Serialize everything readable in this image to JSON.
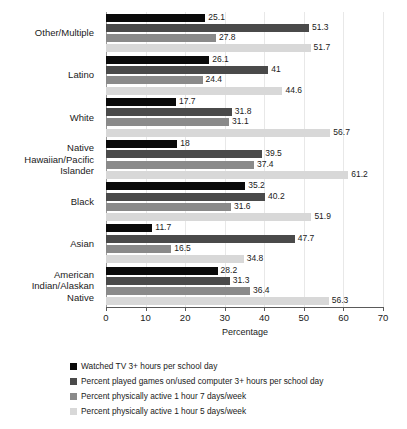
{
  "chart_data": {
    "type": "bar",
    "orientation": "horizontal",
    "title": "",
    "xlabel": "Percentage",
    "ylabel": "",
    "xlim": [
      0,
      70
    ],
    "xticks": [
      0,
      10,
      20,
      30,
      40,
      50,
      60,
      70
    ],
    "grid": true,
    "legend_position": "bottom",
    "categories": [
      "Other/Multiple",
      "Latino",
      "White",
      "Native Hawaiian/Pacific Islander",
      "Black",
      "Asian",
      "American Indian/Alaskan Native"
    ],
    "category_lines": [
      [
        "Other/Multiple"
      ],
      [
        "Latino"
      ],
      [
        "White"
      ],
      [
        "Native",
        "Hawaiian/Pacific",
        "Islander"
      ],
      [
        "Black"
      ],
      [
        "Asian"
      ],
      [
        "American",
        "Indian/Alaskan",
        "Native"
      ]
    ],
    "series": [
      {
        "name": "Watched TV 3+ hours per school day",
        "color": "#0a0a0a",
        "values": [
          25.1,
          26.1,
          17.7,
          18,
          35.2,
          11.7,
          28.2
        ],
        "labels": [
          "25.1",
          "26.1",
          "17.7",
          "18",
          "35.2",
          "11.7",
          "28.2"
        ]
      },
      {
        "name": "Percent played games on/used computer 3+ hours per school day",
        "color": "#4a4a4a",
        "values": [
          51.3,
          41,
          31.8,
          39.5,
          40.2,
          47.7,
          31.3
        ],
        "labels": [
          "51.3",
          "41",
          "31.8",
          "39.5",
          "40.2",
          "47.7",
          "31.3"
        ]
      },
      {
        "name": "Percent physically active 1 hour 7 days/week",
        "color": "#8a8a8a",
        "values": [
          27.8,
          24.4,
          31.1,
          37.4,
          31.6,
          16.5,
          36.4
        ],
        "labels": [
          "27.8",
          "24.4",
          "31.1",
          "37.4",
          "31.6",
          "16.5",
          "36.4"
        ]
      },
      {
        "name": "Percent physically active 1 hour 5 days/week",
        "color": "#d8d8d8",
        "values": [
          51.7,
          44.6,
          56.7,
          61.2,
          51.9,
          34.8,
          56.3
        ],
        "labels": [
          "51.7",
          "44.6",
          "56.7",
          "61.2",
          "51.9",
          "34.8",
          "56.3"
        ]
      }
    ]
  }
}
